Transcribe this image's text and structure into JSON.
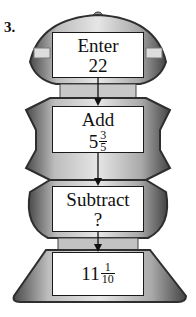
{
  "problem_number": "3.",
  "machine": {
    "steps": [
      {
        "label": "Enter",
        "value": "22"
      },
      {
        "label": "Add",
        "value_whole": "5",
        "value_num": "3",
        "value_den": "5"
      },
      {
        "label": "Subtract",
        "value": "?"
      },
      {
        "label": "",
        "value_whole": "11",
        "value_num": "1",
        "value_den": "10"
      }
    ]
  },
  "colors": {
    "box_border": "#1a1a1a",
    "robot_dark": "#3a3a3a",
    "robot_mid": "#8a8a8a",
    "robot_light": "#cfcfcf"
  }
}
